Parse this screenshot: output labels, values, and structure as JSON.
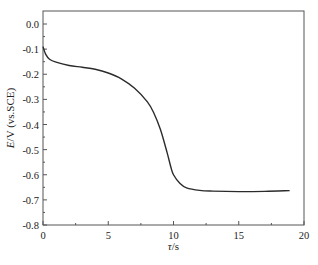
{
  "chart_data": {
    "type": "line",
    "title": "",
    "xlabel": "τ/s",
    "xlabel_italic_part": "τ",
    "xlabel_rest": "/s",
    "ylabel": "E/V (vs.SCE)",
    "ylabel_italic_part": "E",
    "ylabel_rest": "/V (vs.SCE)",
    "xlim": [
      0,
      20
    ],
    "ylim": [
      -0.8,
      0.05
    ],
    "xticks": [
      0,
      5,
      10,
      15,
      20
    ],
    "xtick_labels": [
      "0",
      "5",
      "10",
      "15",
      "20"
    ],
    "yticks": [
      0.0,
      -0.1,
      -0.2,
      -0.3,
      -0.4,
      -0.5,
      -0.6,
      -0.7,
      -0.8
    ],
    "ytick_labels": [
      "0.0",
      "-0.1",
      "-0.2",
      "-0.3",
      "-0.4",
      "-0.5",
      "-0.6",
      "-0.7",
      "-0.8"
    ],
    "grid": false,
    "legend": null,
    "series": [
      {
        "name": "E vs τ",
        "color": "#2b2b2b",
        "x": [
          0,
          0.2,
          0.5,
          1,
          2,
          3,
          4,
          5,
          6,
          7,
          8,
          8.5,
          9,
          9.5,
          9.8,
          10,
          10.5,
          11,
          12,
          13,
          15,
          17,
          18.9
        ],
        "y": [
          -0.09,
          -0.12,
          -0.14,
          -0.152,
          -0.165,
          -0.172,
          -0.18,
          -0.195,
          -0.218,
          -0.255,
          -0.31,
          -0.355,
          -0.42,
          -0.51,
          -0.57,
          -0.6,
          -0.635,
          -0.652,
          -0.662,
          -0.665,
          -0.667,
          -0.666,
          -0.663
        ]
      }
    ]
  }
}
